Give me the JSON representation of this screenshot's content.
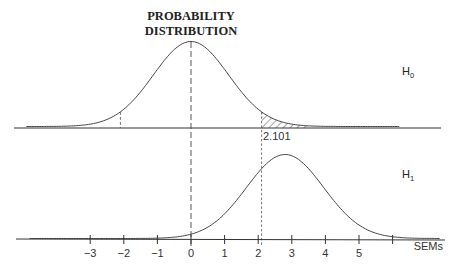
{
  "chart_data": {
    "type": "line",
    "title": "PROBABILITY DISTRIBUTION",
    "title_lines": [
      "PROBABILITY",
      "DISTRIBUTION"
    ],
    "xlabel": "SEMs",
    "ylabel": "",
    "x_ticks": [
      -3,
      -2,
      -1,
      0,
      1,
      2,
      3,
      4,
      5,
      6
    ],
    "x_tick_labels": [
      "−3",
      "−2",
      "−1",
      "0",
      "1",
      "2",
      "3",
      "4",
      "5",
      ""
    ],
    "xlim": [
      -5,
      7.5
    ],
    "grid": false,
    "series": [
      {
        "name": "H0",
        "label_main": "H",
        "label_sub": "0",
        "distribution": "t-like (normal)",
        "mean": 0,
        "sd": 1,
        "panel": "top",
        "shaded_region": {
          "from": 2.101,
          "to": 3.5,
          "pattern": "hatched"
        },
        "markers": [
          {
            "x": -2.101,
            "style": "dashed"
          },
          {
            "x": 0,
            "style": "dashed"
          },
          {
            "x": 2.101,
            "style": "dashed"
          }
        ]
      },
      {
        "name": "H1",
        "label_main": "H",
        "label_sub": "1",
        "distribution": "normal",
        "mean": 2.8,
        "sd": 1,
        "panel": "bottom"
      }
    ],
    "annotations": [
      {
        "text": "2.101",
        "x": 2.101,
        "description": "critical value"
      }
    ]
  }
}
